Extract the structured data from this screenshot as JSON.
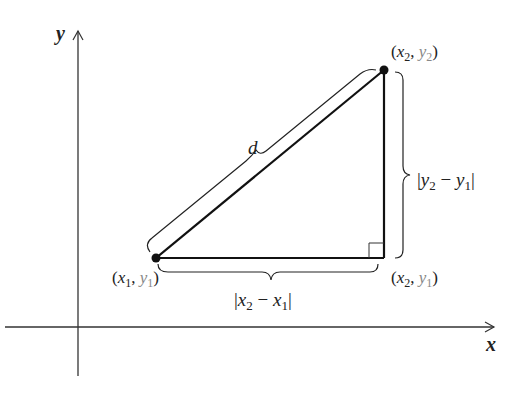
{
  "diagram": {
    "type": "distance-formula-right-triangle",
    "axes": {
      "x_label": "x",
      "y_label": "y"
    },
    "points": [
      {
        "id": "p1",
        "label": "(x₁, y₁)",
        "x_sub": "1",
        "y_sub": "1"
      },
      {
        "id": "p2",
        "label": "(x₂, y₂)",
        "x_sub": "2",
        "y_sub": "2"
      },
      {
        "id": "p3",
        "label": "(x₂, y₁)",
        "x_sub": "2",
        "y_sub": "1"
      }
    ],
    "hypotenuse_label": "d",
    "horizontal_leg_label": "|x₂ − x₁|",
    "vertical_leg_label": "|y₂ − y₁|",
    "right_angle_marker": true,
    "colors": {
      "line": "#111111",
      "axis": "#333333",
      "text": "#222222",
      "background": "#ffffff"
    }
  }
}
